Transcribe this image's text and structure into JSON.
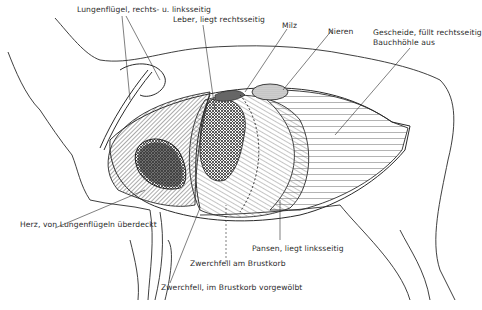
{
  "diagram": {
    "labels": {
      "lungs": "Lungenflügel, rechts- u. linksseitig",
      "liver": "Leber, liegt rechtsseitig",
      "spleen": "Milz",
      "kidneys": "Nieren",
      "intestines_line1": "Gescheide, füllt rechtsseitig",
      "intestines_line2": "Bauchhöhle aus",
      "heart": "Herz, von Lungenflügeln überdeckt",
      "rumen": "Pansen, liegt linksseitig",
      "diaphragm_ribcage": "Zwerchfell am Brustkorb",
      "diaphragm_arched": "Zwerchfell, im Brustkorb vorgewölbt"
    },
    "colors": {
      "line": "#2a2a2a",
      "heart_fill": "#3a3a3a",
      "background": "#ffffff"
    }
  }
}
